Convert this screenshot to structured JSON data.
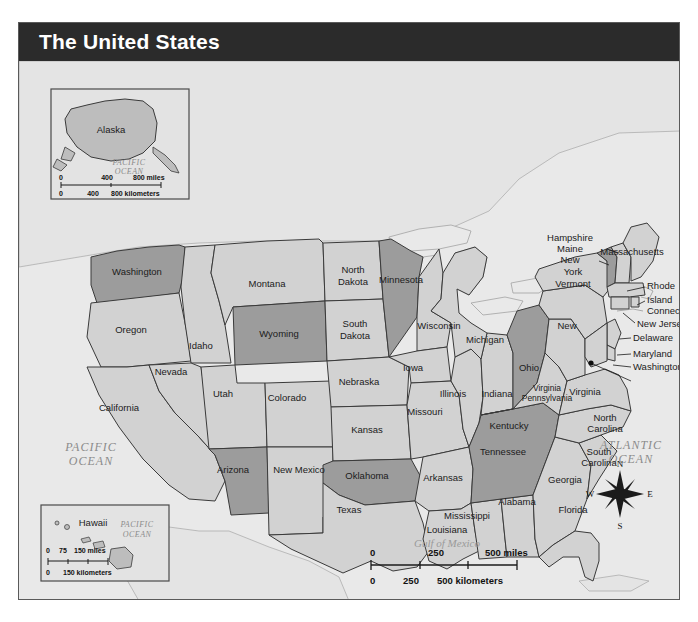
{
  "title": "The United States",
  "frame": {
    "background_color": "#e9e9e9",
    "title_bar_color": "#2b2b2b",
    "border_color": "#5a5a5a"
  },
  "palette": {
    "state_light": "#d2d2d2",
    "state_dark": "#9c9c9c",
    "state_pale": "#dedede",
    "water": "#e9e9e9",
    "outline": "#3a3a3a"
  },
  "oceans": [
    {
      "name": "pacific-ocean-label",
      "line1": "PACIFIC",
      "line2": "OCEAN"
    },
    {
      "name": "atlantic-ocean-label",
      "line1": "ATLANTIC",
      "line2": "OCEAN"
    },
    {
      "name": "gulf-of-mexico-label",
      "line1": "Gulf of Mexico"
    }
  ],
  "states": [
    {
      "name": "washington",
      "label": "Washington",
      "shade": "dark"
    },
    {
      "name": "oregon",
      "label": "Oregon",
      "shade": "light"
    },
    {
      "name": "idaho",
      "label": "Idaho",
      "shade": "light"
    },
    {
      "name": "montana",
      "label": "Montana",
      "shade": "light"
    },
    {
      "name": "north-dakota",
      "label": "North\nDakota",
      "shade": "light"
    },
    {
      "name": "north-dakota-l1",
      "label": "North",
      "shade": "light"
    },
    {
      "name": "north-dakota-l2",
      "label": "Dakota",
      "shade": "light"
    },
    {
      "name": "south-dakota-l1",
      "label": "South",
      "shade": "light"
    },
    {
      "name": "south-dakota-l2",
      "label": "Dakota",
      "shade": "light"
    },
    {
      "name": "minnesota",
      "label": "Minnesota",
      "shade": "dark"
    },
    {
      "name": "wisconsin",
      "label": "Wisconsin",
      "shade": "light"
    },
    {
      "name": "michigan",
      "label": "Michigan",
      "shade": "light"
    },
    {
      "name": "wyoming",
      "label": "Wyoming",
      "shade": "dark"
    },
    {
      "name": "nebraska",
      "label": "Nebraska",
      "shade": "light"
    },
    {
      "name": "iowa",
      "label": "Iowa",
      "shade": "light"
    },
    {
      "name": "illinois",
      "label": "Illinois",
      "shade": "light"
    },
    {
      "name": "indiana",
      "label": "Indiana",
      "shade": "light"
    },
    {
      "name": "ohio",
      "label": "Ohio",
      "shade": "dark"
    },
    {
      "name": "nevada",
      "label": "Nevada",
      "shade": "light"
    },
    {
      "name": "utah",
      "label": "Utah",
      "shade": "light"
    },
    {
      "name": "colorado",
      "label": "Colorado",
      "shade": "light"
    },
    {
      "name": "kansas",
      "label": "Kansas",
      "shade": "light"
    },
    {
      "name": "missouri",
      "label": "Missouri",
      "shade": "light"
    },
    {
      "name": "kentucky",
      "label": "Kentucky",
      "shade": "light"
    },
    {
      "name": "california",
      "label": "California",
      "shade": "light"
    },
    {
      "name": "arizona",
      "label": "Arizona",
      "shade": "dark"
    },
    {
      "name": "new-mexico",
      "label": "New Mexico",
      "shade": "light"
    },
    {
      "name": "oklahoma",
      "label": "Oklahoma",
      "shade": "dark"
    },
    {
      "name": "arkansas",
      "label": "Arkansas",
      "shade": "light"
    },
    {
      "name": "tennessee",
      "label": "Tennessee",
      "shade": "dark"
    },
    {
      "name": "texas",
      "label": "Texas",
      "shade": "light"
    },
    {
      "name": "louisiana",
      "label": "Louisiana",
      "shade": "light"
    },
    {
      "name": "mississippi",
      "label": "Mississippi",
      "shade": "light"
    },
    {
      "name": "alabama",
      "label": "Alabama",
      "shade": "light"
    },
    {
      "name": "georgia",
      "label": "Georgia",
      "shade": "light"
    },
    {
      "name": "florida",
      "label": "Florida",
      "shade": "light"
    },
    {
      "name": "south-carolina-l1",
      "label": "South",
      "shade": "light"
    },
    {
      "name": "south-carolina-l2",
      "label": "Carolina",
      "shade": "light"
    },
    {
      "name": "north-carolina-l1",
      "label": "North",
      "shade": "light"
    },
    {
      "name": "north-carolina-l2",
      "label": "Carolina",
      "shade": "light"
    },
    {
      "name": "virginia",
      "label": "Virginia",
      "shade": "light"
    },
    {
      "name": "west-virginia-l1",
      "label": "West",
      "shade": "light"
    },
    {
      "name": "west-virginia-l2",
      "label": "Virginia",
      "shade": "light"
    },
    {
      "name": "pennsylvania",
      "label": "Pennsylvania",
      "shade": "light"
    },
    {
      "name": "new-york-l1",
      "label": "New",
      "shade": "light"
    },
    {
      "name": "new-york-l2",
      "label": "York",
      "shade": "light"
    },
    {
      "name": "vermont",
      "label": "Vermont",
      "shade": "dark"
    },
    {
      "name": "new-hampshire-l1",
      "label": "New",
      "shade": "light"
    },
    {
      "name": "new-hampshire-l2",
      "label": "Hampshire",
      "shade": "light"
    },
    {
      "name": "maine",
      "label": "Maine",
      "shade": "light"
    },
    {
      "name": "massachusetts",
      "label": "Massachusetts",
      "shade": "light"
    },
    {
      "name": "rhode-island-l1",
      "label": "Rhode",
      "shade": "light"
    },
    {
      "name": "rhode-island-l2",
      "label": "Island",
      "shade": "light"
    },
    {
      "name": "connecticut",
      "label": "Connecticut",
      "shade": "light"
    },
    {
      "name": "new-jersey",
      "label": "New Jersey",
      "shade": "light"
    },
    {
      "name": "delaware",
      "label": "Delaware",
      "shade": "light"
    },
    {
      "name": "maryland",
      "label": "Maryland",
      "shade": "light"
    },
    {
      "name": "washington-dc",
      "label": "Washington, D.C.",
      "shade": "none"
    }
  ],
  "insets": {
    "alaska": {
      "label": "Alaska",
      "ocean_line1": "PACIFIC",
      "ocean_line2": "OCEAN",
      "scale_miles": {
        "t0": "0",
        "t1": "400",
        "t2": "800 miles"
      },
      "scale_kilometers": {
        "t0": "0",
        "t1": "400",
        "t2": "800 kilometers"
      }
    },
    "hawaii": {
      "label": "Hawaii",
      "ocean_line1": "PACIFIC",
      "ocean_line2": "OCEAN",
      "scale_miles": {
        "t0": "0",
        "t1": "75",
        "t2": "150 miles"
      },
      "scale_kilometers": {
        "t0": "0",
        "t1": "150 kilometers"
      }
    }
  },
  "scale": {
    "miles": {
      "t0": "0",
      "t1": "250",
      "t2": "500 miles"
    },
    "kilometers": {
      "t0": "0",
      "t1": "250",
      "t2": "500 kilometers"
    }
  },
  "compass": {
    "n": "N",
    "e": "E",
    "s": "S",
    "w": "W"
  }
}
